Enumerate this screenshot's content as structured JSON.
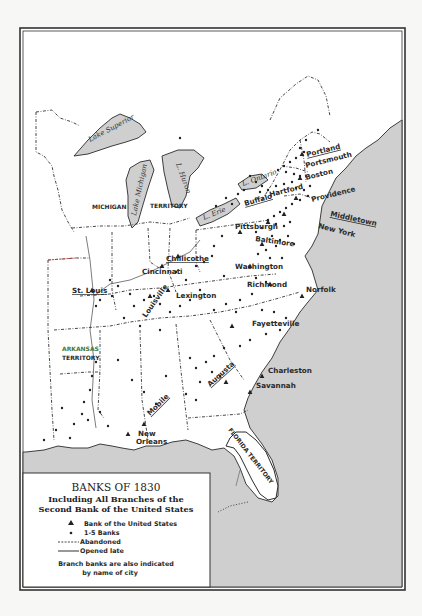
{
  "map": {
    "title": "BANKS OF 1830",
    "subtitle_line1": "Including All Branches of the",
    "subtitle_line2": "Second Bank of the United States",
    "ocean_color": "#cfcfcf",
    "land_color": "#ffffff"
  },
  "legend": {
    "items": [
      {
        "symbol": "triangle",
        "label": "Bank of the United States"
      },
      {
        "symbol": "dot",
        "label": "1-5 Banks"
      },
      {
        "symbol": "dashed-line",
        "label": "Abandoned"
      },
      {
        "symbol": "solid-line",
        "label": "Opened late"
      }
    ],
    "note_line1": "Branch banks are also indicated",
    "note_line2": "by name of city"
  },
  "lakes": {
    "superior": "Lake Superior",
    "michigan": "Lake Michigan",
    "huron": "L. Huron",
    "erie": "L. Erie",
    "ontario": "L. Ontario"
  },
  "territories": {
    "michigan_a": "MICHIGAN",
    "michigan_b": "TERRITORY",
    "arkansas_a": "ARKANSAS",
    "arkansas_b": "TERRITORY",
    "florida": "FLORIDA TERRITORY"
  },
  "cities": {
    "portland": "Portland",
    "portsmouth": "Portsmouth",
    "boston": "Boston",
    "providence": "Providence",
    "hartford": "Hartford",
    "middletown": "Middletown",
    "new_york": "New York",
    "buffalo": "Buffalo",
    "pittsburgh": "Pittsburgh",
    "baltimore": "Baltimore",
    "washington": "Washington",
    "richmond": "Richmond",
    "norfolk": "Norfolk",
    "chillicothe": "Chillicothe",
    "cincinnati": "Cincinnati",
    "lexington": "Lexington",
    "louisville": "Louisville",
    "st_louis": "St. Louis",
    "fayetteville": "Fayetteville",
    "charleston": "Charleston",
    "savannah": "Savannah",
    "augusta": "Augusta",
    "mobile": "Mobile",
    "new_orleans_a": "New",
    "new_orleans_b": "Orleans"
  }
}
